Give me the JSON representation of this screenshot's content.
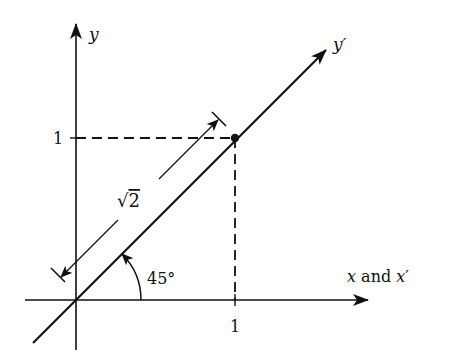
{
  "diagram": {
    "type": "coordinate-rotation",
    "colors": {
      "ink": "#111111",
      "background": "#ffffff"
    },
    "axes": {
      "y_label": "y",
      "y_prime_label": "y",
      "prime_mark": "′",
      "x_label_x": "x",
      "x_label_and": " and ",
      "x_label_xprime": "x",
      "x_prime_mark": "′"
    },
    "ticks": {
      "x_tick": "1",
      "y_tick": "1"
    },
    "dimension": {
      "label_root": "√",
      "label_value": "2",
      "meaning": "length √2 from origin to point (1,1)"
    },
    "angle": {
      "label": "45°"
    },
    "point": {
      "x": 1,
      "y": 1
    }
  }
}
